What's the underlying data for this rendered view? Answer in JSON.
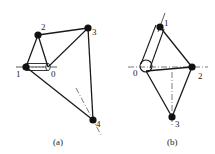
{
  "figure_a": {
    "caption": "(a)",
    "labels": {
      "p1": "1",
      "p0": "0",
      "p2": "2",
      "p3": "3",
      "p4": "4"
    }
  },
  "figure_b": {
    "caption": "(b)",
    "labels": {
      "p0": "0",
      "p1": "1",
      "p2": "2",
      "p3": "3"
    }
  },
  "colors": {
    "line": "#1a1a1a",
    "joint": "#111111",
    "axis": "#555555"
  }
}
